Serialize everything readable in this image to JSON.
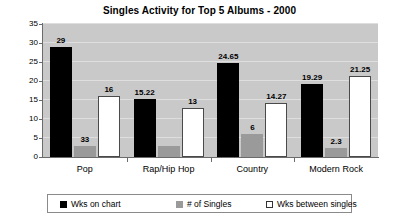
{
  "chart_data": {
    "type": "bar",
    "title": "Singles Activity for Top 5 Albums - 2000",
    "xlabel": "",
    "ylabel": "weeks",
    "ylim": [
      0,
      35
    ],
    "yticks": [
      0,
      5,
      10,
      15,
      20,
      25,
      30,
      35
    ],
    "grid": true,
    "legend_position": "bottom",
    "categories": [
      "Pop",
      "Rap/Hip Hop",
      "Country",
      "Modern Rock"
    ],
    "series": [
      {
        "name": "Wks on chart",
        "color": "#000000",
        "values": [
          29,
          15.22,
          24.65,
          19.29
        ],
        "labels": [
          "29",
          "15.22",
          "24.65",
          "19.29"
        ]
      },
      {
        "name": "# of Singles",
        "color": "#9a9a9a",
        "values": [
          3,
          2.8,
          6,
          2.3
        ],
        "labels": [
          "33",
          "",
          "6",
          "2.3"
        ]
      },
      {
        "name": "Wks between singles",
        "color": "#ffffff",
        "values": [
          16,
          13,
          14.27,
          21.25
        ],
        "labels": [
          "16",
          "13",
          "14.27",
          "21.25"
        ]
      }
    ]
  },
  "legend": {
    "items": [
      {
        "label": "Wks on chart",
        "swatch": "black"
      },
      {
        "label": "# of Singles",
        "swatch": "gray"
      },
      {
        "label": "Wks between singles",
        "swatch": "white"
      }
    ]
  },
  "colors": {
    "plot_background": "#c9c9c9",
    "gridline": "#dedede",
    "axis": "#6b6b6b",
    "series_black": "#000000",
    "series_gray": "#9a9a9a",
    "series_white": "#ffffff"
  }
}
